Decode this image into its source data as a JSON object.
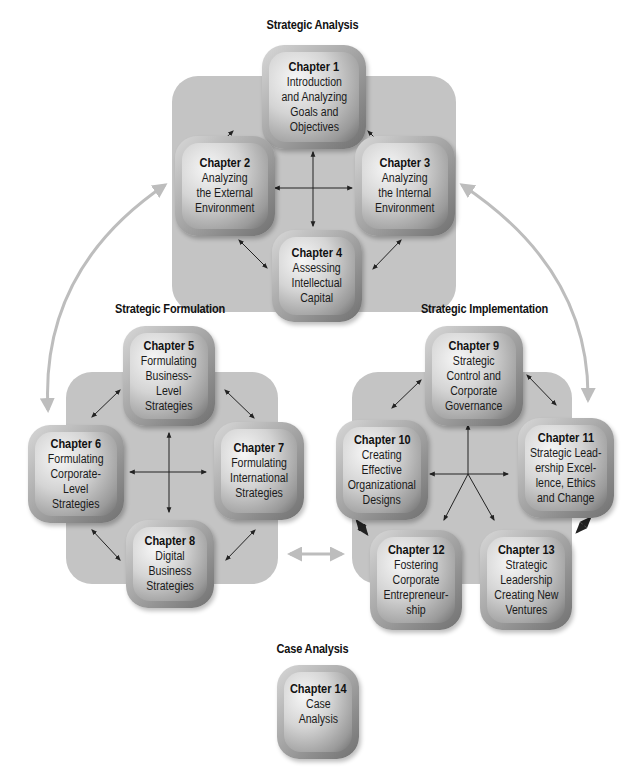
{
  "diagram": {
    "sections": {
      "analysis": {
        "title": "Strategic Analysis"
      },
      "formulation": {
        "title": "Strategic Formulation"
      },
      "implementation": {
        "title": "Strategic Implementation"
      },
      "case": {
        "title": "Case Analysis"
      }
    },
    "chapters": [
      {
        "num": "Chapter 1",
        "title": "Introduction\nand Analyzing\nGoals and\nObjectives",
        "section": "analysis"
      },
      {
        "num": "Chapter 2",
        "title": "Analyzing\nthe External\nEnvironment",
        "section": "analysis"
      },
      {
        "num": "Chapter 3",
        "title": "Analyzing\nthe Internal\nEnvironment",
        "section": "analysis"
      },
      {
        "num": "Chapter 4",
        "title": "Assessing\nIntellectual\nCapital",
        "section": "analysis"
      },
      {
        "num": "Chapter 5",
        "title": "Formulating\nBusiness-\nLevel\nStrategies",
        "section": "formulation"
      },
      {
        "num": "Chapter 6",
        "title": "Formulating\nCorporate-\nLevel\nStrategies",
        "section": "formulation"
      },
      {
        "num": "Chapter 7",
        "title": "Formulating\nInternational\nStrategies",
        "section": "formulation"
      },
      {
        "num": "Chapter 8",
        "title": "Digital\nBusiness\nStrategies",
        "section": "formulation"
      },
      {
        "num": "Chapter 9",
        "title": "Strategic\nControl and\nCorporate\nGovernance",
        "section": "implementation"
      },
      {
        "num": "Chapter 10",
        "title": "Creating\nEffective\nOrganizational\nDesigns",
        "section": "implementation"
      },
      {
        "num": "Chapter 11",
        "title": "Strategic Lead-\nership Excel-\nlence, Ethics\nand Change",
        "section": "implementation"
      },
      {
        "num": "Chapter 12",
        "title": "Fostering\nCorporate\nEntrepreneur-\nship",
        "section": "implementation"
      },
      {
        "num": "Chapter 13",
        "title": "Strategic\nLeadership\nCreating New\nVentures",
        "section": "implementation"
      },
      {
        "num": "Chapter 14",
        "title": "Case\nAnalysis",
        "section": "case"
      }
    ],
    "colors": {
      "panel": "#c4c4c4",
      "arrow": "#222222",
      "flow_arrow": "#bdbdbd"
    }
  }
}
